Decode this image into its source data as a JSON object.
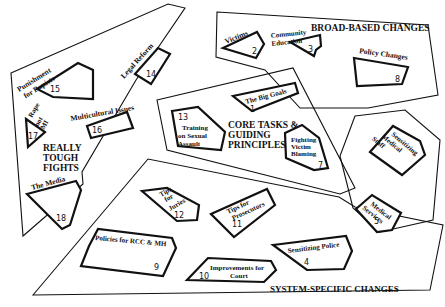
{
  "diagram": {
    "regions": [
      {
        "id": "broad",
        "title": "BROAD-BASED CHANGES"
      },
      {
        "id": "tough",
        "title_lines": [
          "REALLY",
          "TOUGH",
          "FIGHTS"
        ]
      },
      {
        "id": "core",
        "title_lines": [
          "CORE TASKS &",
          "GUIDING",
          "PRINCIPLES"
        ]
      },
      {
        "id": "medical",
        "title": ""
      },
      {
        "id": "system",
        "title": "SYSTEM-SPECIFIC CHANGES"
      }
    ],
    "items": {
      "i1": {
        "number": "1",
        "label": "The Big Goals"
      },
      "i2": {
        "number": "2",
        "label": "Victims"
      },
      "i3": {
        "number": "3",
        "label_lines": [
          "Community",
          "Education"
        ]
      },
      "i4": {
        "number": "4",
        "label": "Sensitizing Police"
      },
      "i5": {
        "number": "5",
        "label_lines": [
          "Medical",
          "Services"
        ]
      },
      "i6": {
        "number": "",
        "label_lines": [
          "Sensitizing",
          "Medical",
          "Staff"
        ]
      },
      "i7": {
        "number": "7",
        "label_lines": [
          "Fighting",
          "Victim",
          "Blaming"
        ]
      },
      "i8": {
        "number": "8",
        "label": "Policy Changes"
      },
      "i9": {
        "number": "9",
        "label": "Policies for RCC & MH"
      },
      "i10": {
        "number": "10",
        "label_lines": [
          "Improvements for",
          "Court"
        ]
      },
      "i11": {
        "number": "11",
        "label_lines": [
          "Tips for",
          "Prosecutors"
        ]
      },
      "i12": {
        "number": "12",
        "label_lines": [
          "Tips",
          "for",
          "Juries"
        ]
      },
      "i13": {
        "number": "13",
        "label_lines": [
          "Training",
          "on Sexual",
          "Assault"
        ]
      },
      "i14": {
        "number": "14",
        "label": "Legal Reform"
      },
      "i15": {
        "number": "15",
        "label_lines": [
          "Punishment",
          "for Rapists"
        ]
      },
      "i16": {
        "number": "16",
        "label": "Multicultural Issues"
      },
      "i17": {
        "number": "17",
        "label_lines": [
          "Rape",
          "not",
          "MI"
        ]
      },
      "i18": {
        "number": "18",
        "label": "The Media"
      }
    }
  }
}
